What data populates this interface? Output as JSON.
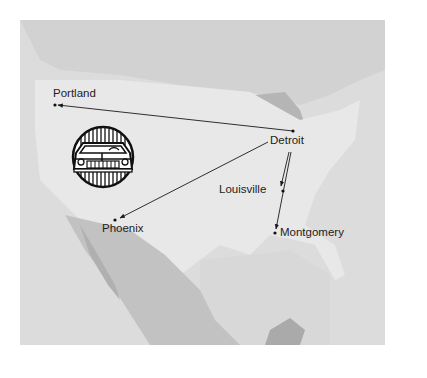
{
  "map": {
    "title": "",
    "origin": "Detroit",
    "cities": [
      {
        "name": "Portland",
        "x": 55,
        "y": 105
      },
      {
        "name": "Detroit",
        "x": 293,
        "y": 131
      },
      {
        "name": "Louisville",
        "x": 281,
        "y": 189
      },
      {
        "name": "Phoenix",
        "x": 115,
        "y": 220
      },
      {
        "name": "Montgomery",
        "x": 275,
        "y": 232
      }
    ],
    "routes": [
      {
        "from": "Detroit",
        "to": "Portland"
      },
      {
        "from": "Detroit",
        "to": "Phoenix"
      },
      {
        "from": "Detroit",
        "to": "Louisville"
      },
      {
        "from": "Detroit",
        "to": "Montgomery"
      }
    ],
    "emblem": "car-icon",
    "colors": {
      "land": "#e6e6e6",
      "land_dark": "#b8b8b8",
      "water": "#d5d5d5",
      "ink": "#1a1a1a"
    }
  }
}
